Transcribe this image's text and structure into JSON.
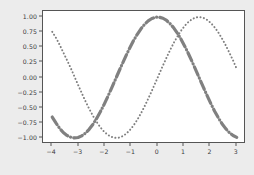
{
  "chart_data": {
    "type": "line",
    "title": "",
    "xlabel": "",
    "ylabel": "",
    "xlim": [
      -4.35,
      3.35
    ],
    "ylim": [
      -1.1,
      1.1
    ],
    "grid": false,
    "legend": null,
    "background_color": "#ececec",
    "axes_facecolor": "#ffffff",
    "axes_edgecolor": "#555555",
    "xticks": [
      -4,
      -3,
      -2,
      -1,
      0,
      1,
      2,
      3
    ],
    "xtick_labels": [
      "−4",
      "−3",
      "−2",
      "−1",
      "0",
      "1",
      "2",
      "3"
    ],
    "yticks": [
      1.0,
      0.75,
      0.5,
      0.25,
      0.0,
      -0.25,
      -0.5,
      -0.75,
      -1.0
    ],
    "ytick_labels": [
      "1.00",
      "0.75",
      "0.50",
      "0.25",
      "0.00",
      "−0.25",
      "−0.50",
      "−0.75",
      "−1.00"
    ],
    "series": [
      {
        "name": "sin(x)",
        "linestyle": "dotted",
        "color": "#808080",
        "linewidth": 2.0,
        "x": [
          -4.0,
          -3.86,
          -3.72,
          -3.58,
          -3.44,
          -3.3,
          -3.16,
          -3.02,
          -2.88,
          -2.74,
          -2.6,
          -2.46,
          -2.32,
          -2.18,
          -2.04,
          -1.9,
          -1.76,
          -1.62,
          -1.48,
          -1.34,
          -1.2,
          -1.06,
          -0.92,
          -0.78,
          -0.64,
          -0.5,
          -0.36,
          -0.22,
          -0.08,
          0.06,
          0.2,
          0.34,
          0.48,
          0.62,
          0.76,
          0.9,
          1.04,
          1.18,
          1.32,
          1.46,
          1.6,
          1.74,
          1.88,
          2.02,
          2.16,
          2.3,
          2.44,
          2.58,
          2.72,
          2.86,
          3.0
        ],
        "y": [
          0.757,
          0.659,
          0.543,
          0.414,
          0.288,
          0.158,
          0.019,
          -0.121,
          -0.258,
          -0.391,
          -0.516,
          -0.63,
          -0.732,
          -0.82,
          -0.892,
          -0.946,
          -0.982,
          -0.999,
          -0.996,
          -0.973,
          -0.932,
          -0.872,
          -0.796,
          -0.703,
          -0.597,
          -0.479,
          -0.352,
          -0.218,
          -0.08,
          0.06,
          0.199,
          0.333,
          0.462,
          0.581,
          0.689,
          0.783,
          0.862,
          0.925,
          0.969,
          0.994,
          1.0,
          0.986,
          0.952,
          0.9,
          0.83,
          0.746,
          0.645,
          0.534,
          0.41,
          0.281,
          0.141
        ]
      },
      {
        "name": "cos(x)",
        "linestyle": "dashdot",
        "color": "#808080",
        "linewidth": 3.2,
        "x": [
          -4.0,
          -3.86,
          -3.72,
          -3.58,
          -3.44,
          -3.3,
          -3.16,
          -3.02,
          -2.88,
          -2.74,
          -2.6,
          -2.46,
          -2.32,
          -2.18,
          -2.04,
          -1.9,
          -1.76,
          -1.62,
          -1.48,
          -1.34,
          -1.2,
          -1.06,
          -0.92,
          -0.78,
          -0.64,
          -0.5,
          -0.36,
          -0.22,
          -0.08,
          0.06,
          0.2,
          0.34,
          0.48,
          0.62,
          0.76,
          0.9,
          1.04,
          1.18,
          1.32,
          1.46,
          1.6,
          1.74,
          1.88,
          2.02,
          2.16,
          2.3,
          2.44,
          2.58,
          2.72,
          2.86,
          3.0
        ],
        "y": [
          -0.654,
          -0.752,
          -0.84,
          -0.91,
          -0.958,
          -0.987,
          -1.0,
          -0.993,
          -0.966,
          -0.921,
          -0.857,
          -0.777,
          -0.681,
          -0.572,
          -0.452,
          -0.323,
          -0.188,
          -0.049,
          0.091,
          0.228,
          0.362,
          0.489,
          0.606,
          0.711,
          0.802,
          0.878,
          0.936,
          0.976,
          0.997,
          0.998,
          0.98,
          0.943,
          0.887,
          0.814,
          0.725,
          0.622,
          0.506,
          0.381,
          0.248,
          0.111,
          -0.029,
          -0.168,
          -0.305,
          -0.435,
          -0.557,
          -0.666,
          -0.764,
          -0.846,
          -0.912,
          -0.96,
          -0.99
        ]
      }
    ]
  }
}
